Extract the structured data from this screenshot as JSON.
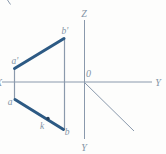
{
  "figure": {
    "axes": {
      "z_label": "Z",
      "y_right_label": "Y",
      "y_bottom_label": "Y",
      "x_left_label": "X",
      "origin_label": "0"
    },
    "points": {
      "a_prime": "a'",
      "b_prime": "b'",
      "a": "a",
      "b": "b",
      "k": "k"
    },
    "colors": {
      "axis": "#8a99ac",
      "segment": "#2d5a84",
      "label": "#8494a6",
      "dot": "#24415e",
      "background": "#fdfdfc"
    }
  }
}
